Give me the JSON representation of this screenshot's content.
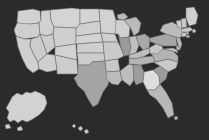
{
  "map": {
    "title": "United States Choropleth Map",
    "projection": "albers-usa",
    "background_color": "#2b2b2b",
    "border_color": "#6e6e6e",
    "border_width": 0.55,
    "legend_visible": false,
    "labels_visible": false,
    "shade_scale": {
      "lightest": "#dcdcdc",
      "light": "#cfcfcf",
      "mid_light": "#c0c0c0",
      "mid": "#ababab",
      "mid_dark": "#999999",
      "dark": "#8a8a8a",
      "darkest": "#7d7d7d"
    }
  },
  "chart_data": {
    "type": "map",
    "subtitle": "",
    "xlabel": "",
    "ylabel": "",
    "legend_position": "none",
    "grid": false,
    "colorscale": [
      "#dcdcdc",
      "#cfcfcf",
      "#c0c0c0",
      "#ababab",
      "#999999",
      "#8a8a8a",
      "#7d7d7d"
    ],
    "regions": [
      {
        "code": "WA",
        "name": "Washington",
        "value": 1,
        "color": "#d2d2d2"
      },
      {
        "code": "OR",
        "name": "Oregon",
        "value": 1,
        "color": "#cfcfcf"
      },
      {
        "code": "CA",
        "name": "California",
        "value": 1,
        "color": "#d0d0d0"
      },
      {
        "code": "NV",
        "name": "Nevada",
        "value": 1,
        "color": "#cccccc"
      },
      {
        "code": "ID",
        "name": "Idaho",
        "value": 1,
        "color": "#d2d2d2"
      },
      {
        "code": "MT",
        "name": "Montana",
        "value": 1,
        "color": "#d4d4d4"
      },
      {
        "code": "WY",
        "name": "Wyoming",
        "value": 1,
        "color": "#cfcfcf"
      },
      {
        "code": "UT",
        "name": "Utah",
        "value": 1,
        "color": "#cccccc"
      },
      {
        "code": "AZ",
        "name": "Arizona",
        "value": 1,
        "color": "#cfcfcf"
      },
      {
        "code": "CO",
        "name": "Colorado",
        "value": 1,
        "color": "#d2d2d2"
      },
      {
        "code": "NM",
        "name": "New Mexico",
        "value": 1,
        "color": "#cccccc"
      },
      {
        "code": "ND",
        "name": "North Dakota",
        "value": 1,
        "color": "#d4d4d4"
      },
      {
        "code": "SD",
        "name": "South Dakota",
        "value": 1,
        "color": "#d0d0d0"
      },
      {
        "code": "NE",
        "name": "Nebraska",
        "value": 1,
        "color": "#d2d2d2"
      },
      {
        "code": "KS",
        "name": "Kansas",
        "value": 1,
        "color": "#cfcfcf"
      },
      {
        "code": "OK",
        "name": "Oklahoma",
        "value": 1,
        "color": "#cccccc"
      },
      {
        "code": "TX",
        "name": "Texas",
        "value": 3,
        "color": "#a4a4a4"
      },
      {
        "code": "MN",
        "name": "Minnesota",
        "value": 1,
        "color": "#d2d2d2"
      },
      {
        "code": "IA",
        "name": "Iowa",
        "value": 1,
        "color": "#cfcfcf"
      },
      {
        "code": "MO",
        "name": "Missouri",
        "value": 1,
        "color": "#cacaca"
      },
      {
        "code": "AR",
        "name": "Arkansas",
        "value": 1,
        "color": "#c8c8c8"
      },
      {
        "code": "LA",
        "name": "Louisiana",
        "value": 2,
        "color": "#bcbcbc"
      },
      {
        "code": "WI",
        "name": "Wisconsin",
        "value": 1,
        "color": "#cfcfcf"
      },
      {
        "code": "IL",
        "name": "Illinois",
        "value": 4,
        "color": "#9a9a9a"
      },
      {
        "code": "MS",
        "name": "Mississippi",
        "value": 2,
        "color": "#bdbdbd"
      },
      {
        "code": "AL",
        "name": "Alabama",
        "value": 4,
        "color": "#9d9d9d"
      },
      {
        "code": "MI",
        "name": "Michigan",
        "value": 2,
        "color": "#bababa"
      },
      {
        "code": "IN",
        "name": "Indiana",
        "value": 2,
        "color": "#c0c0c0"
      },
      {
        "code": "OH",
        "name": "Ohio",
        "value": 3,
        "color": "#a8a8a8"
      },
      {
        "code": "KY",
        "name": "Kentucky",
        "value": 2,
        "color": "#bebebe"
      },
      {
        "code": "TN",
        "name": "Tennessee",
        "value": 2,
        "color": "#b6b6b6"
      },
      {
        "code": "GA",
        "name": "Georgia",
        "value": 0,
        "color": "#dedede"
      },
      {
        "code": "FL",
        "name": "Florida",
        "value": 2,
        "color": "#b8b8b8"
      },
      {
        "code": "SC",
        "name": "South Carolina",
        "value": 4,
        "color": "#9c9c9c"
      },
      {
        "code": "NC",
        "name": "North Carolina",
        "value": 1,
        "color": "#c9c9c9"
      },
      {
        "code": "VA",
        "name": "Virginia",
        "value": 2,
        "color": "#b3b3b3"
      },
      {
        "code": "WV",
        "name": "West Virginia",
        "value": 1,
        "color": "#c6c6c6"
      },
      {
        "code": "MD",
        "name": "Maryland",
        "value": 1,
        "color": "#cacaca"
      },
      {
        "code": "DE",
        "name": "Delaware",
        "value": 1,
        "color": "#c4c4c4"
      },
      {
        "code": "PA",
        "name": "Pennsylvania",
        "value": 3,
        "color": "#a6a6a6"
      },
      {
        "code": "NJ",
        "name": "New Jersey",
        "value": 2,
        "color": "#bababa"
      },
      {
        "code": "NY",
        "name": "New York",
        "value": 2,
        "color": "#bcbcbc"
      },
      {
        "code": "CT",
        "name": "Connecticut",
        "value": 1,
        "color": "#c6c6c6"
      },
      {
        "code": "RI",
        "name": "Rhode Island",
        "value": 1,
        "color": "#c2c2c2"
      },
      {
        "code": "MA",
        "name": "Massachusetts",
        "value": 1,
        "color": "#cacaca"
      },
      {
        "code": "VT",
        "name": "Vermont",
        "value": 1,
        "color": "#cdcdcd"
      },
      {
        "code": "NH",
        "name": "New Hampshire",
        "value": 1,
        "color": "#c9c9c9"
      },
      {
        "code": "ME",
        "name": "Maine",
        "value": 1,
        "color": "#cfcfcf"
      },
      {
        "code": "AK",
        "name": "Alaska",
        "value": 1,
        "color": "#d2d2d2"
      },
      {
        "code": "HI",
        "name": "Hawaii",
        "value": 1,
        "color": "#cfcfcf"
      }
    ]
  }
}
